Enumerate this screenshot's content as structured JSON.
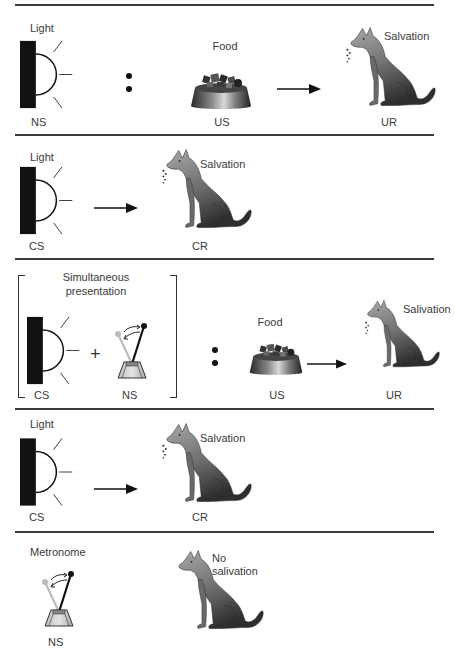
{
  "panels": [
    {
      "id": "before-conditioning",
      "stimulus_label": "Light",
      "stimulus_role": "NS",
      "food_label": "Food",
      "food_role": "US",
      "response_label": "Salvation",
      "response_role": "UR"
    },
    {
      "id": "after-conditioning-1",
      "stimulus_label": "Light",
      "stimulus_role": "CS",
      "response_label": "Salvation",
      "response_role": "CR"
    },
    {
      "id": "higher-order-pairing",
      "bracket_title_line1": "Simultaneous",
      "bracket_title_line2": "presentation",
      "stimulus_role": "CS",
      "plus": "+",
      "metronome_role": "NS",
      "food_label": "Food",
      "food_role": "US",
      "response_label": "Salivation",
      "response_role": "UR"
    },
    {
      "id": "after-conditioning-2",
      "stimulus_label": "Light",
      "stimulus_role": "CS",
      "response_label": "Salvation",
      "response_role": "CR"
    },
    {
      "id": "test",
      "stimulus_label": "Metronome",
      "stimulus_role": "NS",
      "response_line1": "No",
      "response_line2": "salivation"
    }
  ],
  "colors": {
    "divider": "#3a3a3a",
    "lamp": "#111111",
    "dog_light": "#9a9a9a",
    "dog_dark": "#3c3c3c",
    "text": "#3a3a3a"
  }
}
